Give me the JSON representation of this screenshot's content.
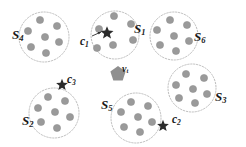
{
  "figure": {
    "type": "cluster-diagram",
    "width": 246,
    "height": 147,
    "background": "#ffffff"
  },
  "colors": {
    "dot_fill": "#9a9a9a",
    "dot_stroke": "#8a8a8a",
    "cluster_outline": "#b5b5b5",
    "star_fill": "#2b2b2b",
    "pentagon_fill": "#8f8f8f",
    "label_color": "#1a1a1a",
    "arrow_color": "#2b2b2b"
  },
  "clusters": [
    {
      "id": "S1",
      "label_base": "S",
      "label_sub": "1",
      "label_x": 134,
      "label_y": 22,
      "cx": 115,
      "cy": 35,
      "r": 24,
      "dots": [
        {
          "x": 114,
          "y": 16
        },
        {
          "x": 131,
          "y": 24
        },
        {
          "x": 99,
          "y": 29
        },
        {
          "x": 133,
          "y": 40
        },
        {
          "x": 113,
          "y": 45
        },
        {
          "x": 97,
          "y": 48
        }
      ]
    },
    {
      "id": "S6",
      "label_base": "S",
      "label_sub": "6",
      "label_x": 194,
      "label_y": 30,
      "cx": 174,
      "cy": 36,
      "r": 24,
      "dots": [
        {
          "x": 170,
          "y": 20
        },
        {
          "x": 187,
          "y": 25
        },
        {
          "x": 157,
          "y": 30
        },
        {
          "x": 174,
          "y": 36
        },
        {
          "x": 189,
          "y": 41
        },
        {
          "x": 160,
          "y": 45
        },
        {
          "x": 176,
          "y": 51
        }
      ]
    },
    {
      "id": "S4",
      "label_base": "S",
      "label_sub": "4",
      "label_x": 12,
      "label_y": 28,
      "cx": 44,
      "cy": 37,
      "r": 25,
      "dots": [
        {
          "x": 40,
          "y": 20
        },
        {
          "x": 57,
          "y": 26
        },
        {
          "x": 28,
          "y": 31
        },
        {
          "x": 45,
          "y": 37
        },
        {
          "x": 59,
          "y": 42
        },
        {
          "x": 31,
          "y": 47
        },
        {
          "x": 46,
          "y": 53
        }
      ]
    },
    {
      "id": "S3",
      "label_base": "S",
      "label_sub": "3",
      "label_x": 215,
      "label_y": 90,
      "cx": 192,
      "cy": 88,
      "r": 24,
      "dots": [
        {
          "x": 186,
          "y": 74
        },
        {
          "x": 204,
          "y": 78
        },
        {
          "x": 176,
          "y": 85
        },
        {
          "x": 193,
          "y": 89
        },
        {
          "x": 207,
          "y": 94
        },
        {
          "x": 179,
          "y": 98
        },
        {
          "x": 195,
          "y": 103
        }
      ]
    },
    {
      "id": "S2",
      "label_base": "S",
      "label_sub": "2",
      "label_x": 22,
      "label_y": 114,
      "cx": 54,
      "cy": 113,
      "r": 25,
      "dots": [
        {
          "x": 48,
          "y": 97
        },
        {
          "x": 65,
          "y": 101
        },
        {
          "x": 38,
          "y": 108
        },
        {
          "x": 55,
          "y": 112
        },
        {
          "x": 70,
          "y": 117
        },
        {
          "x": 41,
          "y": 122
        },
        {
          "x": 57,
          "y": 128
        }
      ]
    },
    {
      "id": "S5",
      "label_base": "S",
      "label_sub": "5",
      "label_x": 101,
      "label_y": 98,
      "cx": 136,
      "cy": 118,
      "r": 25,
      "dots": [
        {
          "x": 131,
          "y": 102
        },
        {
          "x": 148,
          "y": 106
        },
        {
          "x": 121,
          "y": 112
        },
        {
          "x": 138,
          "y": 117
        },
        {
          "x": 152,
          "y": 122
        },
        {
          "x": 124,
          "y": 127
        },
        {
          "x": 140,
          "y": 132
        }
      ]
    }
  ],
  "centroids": [
    {
      "id": "c1",
      "label_base": "c",
      "label_sub": "1",
      "label_x": 80,
      "label_y": 36,
      "x": 107,
      "y": 33,
      "size": 11,
      "arrow": {
        "x1": 92,
        "y1": 36,
        "x2": 101,
        "y2": 32
      }
    },
    {
      "id": "c3",
      "label_base": "c",
      "label_sub": "3",
      "label_x": 67,
      "label_y": 74,
      "x": 62,
      "y": 85,
      "size": 10,
      "arrow": null
    },
    {
      "id": "c2",
      "label_base": "c",
      "label_sub": "2",
      "label_x": 172,
      "label_y": 114,
      "x": 163,
      "y": 126,
      "size": 10,
      "arrow": null
    }
  ],
  "target_node": {
    "id": "v_t",
    "label_base": "v",
    "label_sub": "t",
    "label_x": 122,
    "label_y": 64,
    "x": 118,
    "y": 74,
    "r": 8
  }
}
